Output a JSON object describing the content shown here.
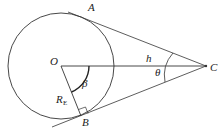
{
  "diagram": {
    "type": "geometry",
    "labels": {
      "A": "A",
      "B": "B",
      "C": "C",
      "O": "O",
      "h": "h",
      "beta": "β",
      "theta": "θ",
      "R": "R",
      "R_sub": "E"
    },
    "colors": {
      "stroke": "#333333",
      "text": "#222222",
      "background": "#ffffff"
    }
  }
}
